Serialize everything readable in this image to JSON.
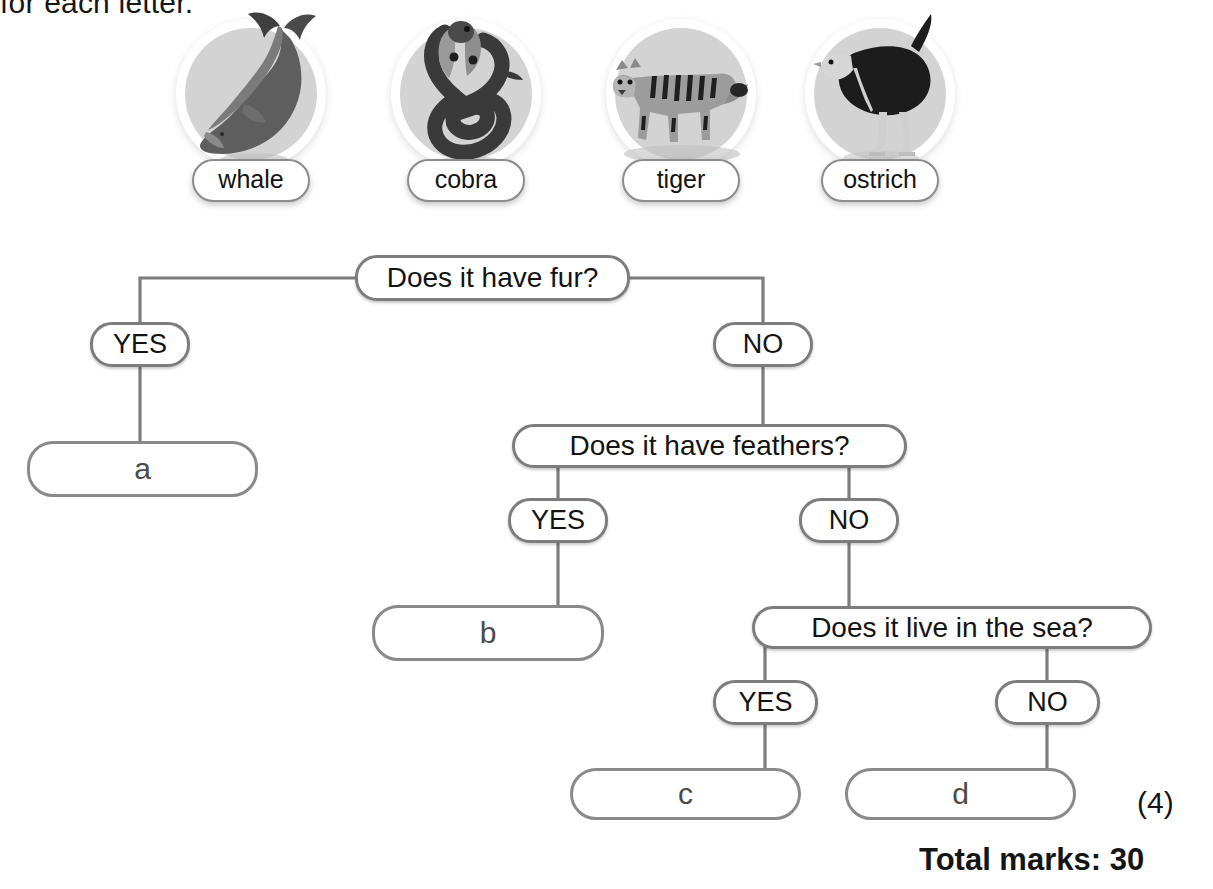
{
  "instruction": "for each letter.",
  "animals": [
    {
      "name": "whale",
      "icon": "whale-illustration"
    },
    {
      "name": "cobra",
      "icon": "cobra-illustration"
    },
    {
      "name": "tiger",
      "icon": "tiger-illustration"
    },
    {
      "name": "ostrich",
      "icon": "ostrich-illustration"
    }
  ],
  "tree": {
    "questions": [
      {
        "id": "q1",
        "text": "Does it have fur?"
      },
      {
        "id": "q2",
        "text": "Does it have feathers?"
      },
      {
        "id": "q3",
        "text": "Does it live in the sea?"
      }
    ],
    "branches": [
      {
        "id": "q1-yes",
        "label": "YES"
      },
      {
        "id": "q1-no",
        "label": "NO"
      },
      {
        "id": "q2-yes",
        "label": "YES"
      },
      {
        "id": "q2-no",
        "label": "NO"
      },
      {
        "id": "q3-yes",
        "label": "YES"
      },
      {
        "id": "q3-no",
        "label": "NO"
      }
    ],
    "answers": [
      {
        "id": "a",
        "label": "a"
      },
      {
        "id": "b",
        "label": "b"
      },
      {
        "id": "c",
        "label": "c"
      },
      {
        "id": "d",
        "label": "d"
      }
    ]
  },
  "footer": {
    "question_marks": "(4)",
    "total_marks": "Total marks: 30"
  },
  "colors": {
    "stroke": "#7d7d7d",
    "circle_fill": "#d3d3d3",
    "text": "#131313",
    "answer_text": "#4a4a4a"
  }
}
